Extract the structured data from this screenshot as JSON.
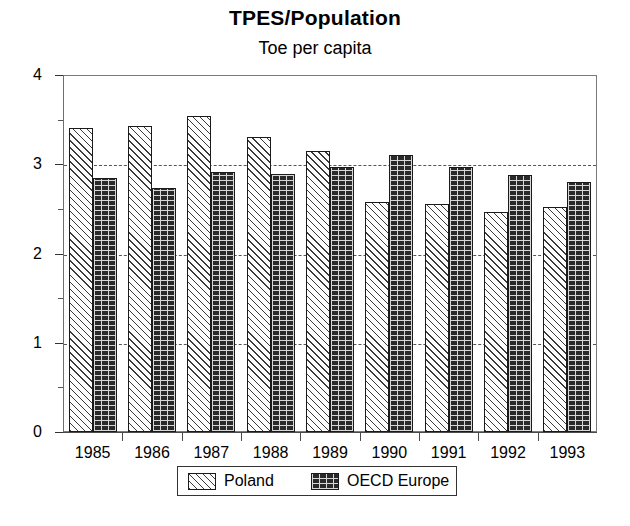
{
  "chart_data": {
    "type": "bar",
    "title": "TPES/Population",
    "subtitle": "Toe per capita",
    "xlabel": "",
    "ylabel": "",
    "ylim": [
      0,
      4
    ],
    "y_major_ticks": [
      0,
      1,
      2,
      3,
      4
    ],
    "y_minor_ticks": [
      0.5,
      1.5,
      2.5,
      3.5
    ],
    "y_tick_labels": [
      "0",
      "1",
      "2",
      "3",
      "4"
    ],
    "grid": "horizontal dashed gridlines at 1, 2, 3",
    "legend_position": "bottom-center",
    "categories": [
      "1985",
      "1986",
      "1987",
      "1988",
      "1989",
      "1990",
      "1991",
      "1992",
      "1993"
    ],
    "series": [
      {
        "name": "Poland",
        "pattern": "diagonal-hatch-light",
        "values": [
          3.41,
          3.43,
          3.54,
          3.3,
          3.15,
          2.58,
          2.55,
          2.47,
          2.52
        ]
      },
      {
        "name": "OECD Europe",
        "pattern": "brick-dark",
        "values": [
          2.85,
          2.73,
          2.91,
          2.89,
          2.97,
          3.1,
          2.97,
          2.88,
          2.8
        ]
      }
    ]
  },
  "colors": {
    "poland_fill": "#fdfdfd",
    "poland_hatch": "#3a3a3a",
    "oecd_fill": "#2a2a2a",
    "oecd_hatch": "#d8d8d8",
    "axis": "#4a4a4a",
    "gridline": "#555555",
    "text": "#000000",
    "background": "#ffffff"
  },
  "legend": {
    "items": [
      {
        "label": "Poland"
      },
      {
        "label": "OECD Europe"
      }
    ]
  }
}
